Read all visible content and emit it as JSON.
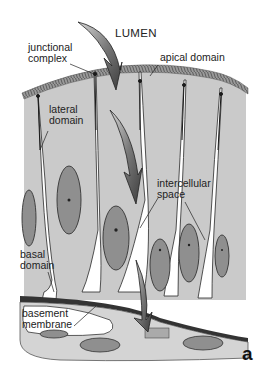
{
  "figure": {
    "panel_label": "a",
    "labels": {
      "lumen": "LUMEN",
      "junctional_complex_1": "junctional",
      "junctional_complex_2": "complex",
      "apical_domain": "apical domain",
      "lateral_domain_1": "lateral",
      "lateral_domain_2": "domain",
      "intercellular_space_1": "intercellular",
      "intercellular_space_2": "space",
      "basal_domain_1": "basal",
      "basal_domain_2": "domain",
      "basement_membrane_1": "basement",
      "basement_membrane_2": "membrane"
    },
    "colors": {
      "cytoplasm": "#c9c9c9",
      "nucleus": "#8f8f8f",
      "arrow": "#6e6e6e",
      "outline": "#2a2a2a",
      "intercellular": "#ffffff"
    }
  }
}
